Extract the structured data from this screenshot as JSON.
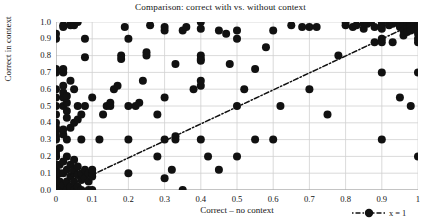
{
  "chart_data": {
    "type": "scatter",
    "title": "Comparison: correct with vs. without context",
    "xlabel": "Correct – no context",
    "ylabel": "Correct in context",
    "xlim": [
      0,
      1
    ],
    "ylim": [
      0,
      1
    ],
    "grid": true,
    "xticks": [
      "0",
      "0.1",
      "0.2",
      "0.3",
      "0.4",
      "0.5",
      "0.6",
      "0.7",
      "0.8",
      "0.9",
      "1"
    ],
    "xtick_values": [
      0,
      0.1,
      0.2,
      0.3,
      0.4,
      0.5,
      0.6,
      0.7,
      0.8,
      0.9,
      1
    ],
    "yticks": [
      "0.0",
      "0.1",
      "0.2",
      "0.3",
      "0.4",
      "0.5",
      "0.6",
      "0.7",
      "0.8",
      "0.9",
      "1.0"
    ],
    "ytick_values": [
      0,
      0.1,
      0.2,
      0.3,
      0.4,
      0.5,
      0.6,
      0.7,
      0.8,
      0.9,
      1.0
    ],
    "marker_color": "#111111",
    "marker_size": 5.2,
    "grid_color": "#d0d0d0",
    "legend": {
      "position": "bottom-right-outside",
      "entries": [
        {
          "label": "x = 1",
          "style": "dashdot-with-marker",
          "color": "#111111"
        }
      ]
    },
    "reference_line": {
      "label": "x = 1",
      "style": "dashdot",
      "color": "#111111",
      "x": [
        0.08,
        1.0
      ],
      "y": [
        0.07,
        1.0
      ]
    },
    "series": [
      {
        "name": "items",
        "points": [
          [
            0.0,
            0.0
          ],
          [
            0.0,
            0.0
          ],
          [
            0.0,
            0.0
          ],
          [
            0.0,
            0.0
          ],
          [
            0.0,
            0.0
          ],
          [
            0.0,
            0.02
          ],
          [
            0.0,
            0.04
          ],
          [
            0.0,
            0.05
          ],
          [
            0.0,
            0.06
          ],
          [
            0.0,
            0.08
          ],
          [
            0.0,
            0.1
          ],
          [
            0.0,
            0.1
          ],
          [
            0.0,
            0.12
          ],
          [
            0.0,
            0.15
          ],
          [
            0.0,
            0.2
          ],
          [
            0.0,
            0.2
          ],
          [
            0.0,
            0.22
          ],
          [
            0.0,
            0.3
          ],
          [
            0.0,
            0.32
          ],
          [
            0.0,
            0.35
          ],
          [
            0.0,
            0.37
          ],
          [
            0.0,
            0.4
          ],
          [
            0.0,
            0.45
          ],
          [
            0.0,
            0.5
          ],
          [
            0.0,
            0.55
          ],
          [
            0.0,
            0.6
          ],
          [
            0.0,
            0.7
          ],
          [
            0.0,
            0.72
          ],
          [
            0.0,
            0.9
          ],
          [
            0.0,
            0.93
          ],
          [
            0.01,
            0.0
          ],
          [
            0.01,
            0.05
          ],
          [
            0.01,
            0.1
          ],
          [
            0.01,
            0.15
          ],
          [
            0.01,
            0.25
          ],
          [
            0.02,
            0.0
          ],
          [
            0.02,
            0.03
          ],
          [
            0.02,
            0.1
          ],
          [
            0.02,
            0.17
          ],
          [
            0.02,
            0.33
          ],
          [
            0.02,
            0.36
          ],
          [
            0.02,
            0.5
          ],
          [
            0.02,
            0.55
          ],
          [
            0.02,
            0.58
          ],
          [
            0.02,
            0.62
          ],
          [
            0.02,
            0.7
          ],
          [
            0.02,
            0.72
          ],
          [
            0.02,
            0.97
          ],
          [
            0.02,
            0.98
          ],
          [
            0.03,
            0.0
          ],
          [
            0.03,
            0.05
          ],
          [
            0.03,
            0.12
          ],
          [
            0.03,
            0.2
          ],
          [
            0.03,
            0.3
          ],
          [
            0.03,
            0.43
          ],
          [
            0.03,
            0.47
          ],
          [
            0.03,
            0.52
          ],
          [
            0.03,
            0.56
          ],
          [
            0.04,
            0.0
          ],
          [
            0.04,
            0.02
          ],
          [
            0.04,
            0.08
          ],
          [
            0.04,
            0.15
          ],
          [
            0.04,
            0.37
          ],
          [
            0.04,
            0.65
          ],
          [
            0.04,
            0.98
          ],
          [
            0.04,
            1.0
          ],
          [
            0.05,
            0.0
          ],
          [
            0.05,
            0.05
          ],
          [
            0.05,
            0.1
          ],
          [
            0.05,
            0.11
          ],
          [
            0.05,
            0.12
          ],
          [
            0.05,
            0.18
          ],
          [
            0.05,
            0.4
          ],
          [
            0.05,
            0.6
          ],
          [
            0.05,
            0.98
          ],
          [
            0.06,
            0.0
          ],
          [
            0.06,
            0.02
          ],
          [
            0.06,
            0.09
          ],
          [
            0.06,
            0.14
          ],
          [
            0.06,
            0.42
          ],
          [
            0.06,
            0.5
          ],
          [
            0.06,
            1.0
          ],
          [
            0.07,
            0.0
          ],
          [
            0.07,
            0.06
          ],
          [
            0.07,
            0.1
          ],
          [
            0.07,
            0.3
          ],
          [
            0.07,
            0.45
          ],
          [
            0.08,
            0.07
          ],
          [
            0.08,
            0.12
          ],
          [
            0.08,
            0.5
          ],
          [
            0.08,
            0.79
          ],
          [
            0.08,
            0.9
          ],
          [
            0.09,
            0.0
          ],
          [
            0.09,
            0.05
          ],
          [
            0.09,
            0.1
          ],
          [
            0.1,
            0.0
          ],
          [
            0.1,
            0.08
          ],
          [
            0.1,
            0.1
          ],
          [
            0.1,
            0.12
          ],
          [
            0.1,
            0.55
          ],
          [
            0.12,
            0.3
          ],
          [
            0.13,
            0.45
          ],
          [
            0.14,
            0.5
          ],
          [
            0.15,
            0.5
          ],
          [
            0.15,
            0.52
          ],
          [
            0.16,
            0.6
          ],
          [
            0.17,
            0.62
          ],
          [
            0.18,
            0.78
          ],
          [
            0.18,
            0.8
          ],
          [
            0.19,
            0.97
          ],
          [
            0.2,
            0.1
          ],
          [
            0.2,
            0.3
          ],
          [
            0.2,
            0.5
          ],
          [
            0.2,
            0.9
          ],
          [
            0.22,
            0.5
          ],
          [
            0.23,
            0.52
          ],
          [
            0.24,
            0.65
          ],
          [
            0.25,
            0.8
          ],
          [
            0.25,
            0.82
          ],
          [
            0.26,
            0.98
          ],
          [
            0.28,
            0.45
          ],
          [
            0.28,
            0.2
          ],
          [
            0.3,
            0.07
          ],
          [
            0.3,
            0.3
          ],
          [
            0.3,
            0.55
          ],
          [
            0.3,
            0.95
          ],
          [
            0.3,
            0.97
          ],
          [
            0.32,
            0.12
          ],
          [
            0.33,
            0.3
          ],
          [
            0.33,
            0.32
          ],
          [
            0.33,
            0.75
          ],
          [
            0.35,
            0.0
          ],
          [
            0.35,
            0.95
          ],
          [
            0.36,
            0.97
          ],
          [
            0.38,
            0.6
          ],
          [
            0.4,
            0.3
          ],
          [
            0.4,
            1.0
          ],
          [
            0.4,
            0.78
          ],
          [
            0.4,
            0.8
          ],
          [
            0.4,
            0.77
          ],
          [
            0.4,
            0.62
          ],
          [
            0.4,
            0.65
          ],
          [
            0.4,
            0.96
          ],
          [
            0.42,
            0.2
          ],
          [
            0.45,
            0.12
          ],
          [
            0.48,
            0.75
          ],
          [
            0.5,
            0.5
          ],
          [
            0.5,
            0.9
          ],
          [
            0.5,
            0.95
          ],
          [
            0.52,
            0.6
          ],
          [
            0.55,
            0.3
          ],
          [
            0.55,
            0.72
          ],
          [
            0.58,
            0.85
          ],
          [
            0.6,
            0.3
          ],
          [
            0.6,
            0.95
          ],
          [
            0.62,
            0.5
          ],
          [
            0.65,
            0.98
          ],
          [
            0.68,
            0.97
          ],
          [
            0.7,
            0.6
          ],
          [
            0.7,
            0.97
          ],
          [
            0.72,
            0.97
          ],
          [
            0.75,
            0.45
          ],
          [
            0.78,
            0.8
          ],
          [
            0.8,
            0.98
          ],
          [
            0.8,
            1.0
          ],
          [
            0.82,
            0.97
          ],
          [
            0.83,
            0.98
          ],
          [
            0.85,
            0.99
          ],
          [
            0.85,
            0.96
          ],
          [
            0.86,
            0.99
          ],
          [
            0.87,
            1.0
          ],
          [
            0.88,
            0.97
          ],
          [
            0.88,
            0.88
          ],
          [
            0.9,
            1.0
          ],
          [
            0.9,
            0.98
          ],
          [
            0.9,
            0.96
          ],
          [
            0.9,
            0.9
          ],
          [
            0.9,
            0.88
          ],
          [
            0.9,
            0.7
          ],
          [
            0.9,
            0.3
          ],
          [
            0.92,
            1.0
          ],
          [
            0.92,
            0.98
          ],
          [
            0.93,
            0.99
          ],
          [
            0.93,
            0.88
          ],
          [
            0.94,
            1.0
          ],
          [
            0.95,
            0.99
          ],
          [
            0.95,
            0.97
          ],
          [
            0.95,
            0.55
          ],
          [
            0.96,
            1.0
          ],
          [
            0.96,
            0.98
          ],
          [
            0.96,
            0.95
          ],
          [
            0.96,
            0.92
          ],
          [
            0.97,
            1.0
          ],
          [
            0.97,
            0.98
          ],
          [
            0.97,
            0.96
          ],
          [
            0.97,
            0.94
          ],
          [
            0.98,
            1.0
          ],
          [
            0.98,
            0.99
          ],
          [
            0.98,
            0.97
          ],
          [
            0.98,
            0.95
          ],
          [
            0.98,
            0.5
          ],
          [
            0.99,
            1.0
          ],
          [
            0.99,
            0.98
          ],
          [
            0.99,
            0.96
          ],
          [
            1.0,
            1.0
          ],
          [
            1.0,
            0.99
          ],
          [
            1.0,
            0.98
          ],
          [
            1.0,
            0.97
          ],
          [
            1.0,
            0.96
          ],
          [
            1.0,
            0.95
          ],
          [
            1.0,
            0.93
          ],
          [
            1.0,
            0.9
          ],
          [
            1.0,
            0.88
          ],
          [
            1.0,
            0.7
          ],
          [
            1.0,
            0.2
          ],
          [
            0.45,
            0.95
          ],
          [
            0.47,
            0.93
          ],
          [
            0.5,
            0.2
          ]
        ]
      }
    ]
  }
}
